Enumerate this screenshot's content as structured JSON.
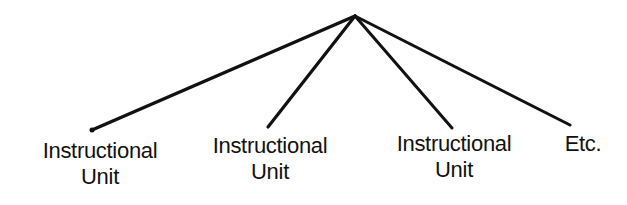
{
  "diagram": {
    "type": "tree",
    "root": {
      "x": 355,
      "y": 16
    },
    "stroke_color": "#111111",
    "branches": [
      {
        "end": {
          "x": 92,
          "y": 130
        },
        "label_lines": [
          "Instructional",
          "Unit"
        ],
        "label_x": 100,
        "label_y": 138
      },
      {
        "end": {
          "x": 268,
          "y": 127
        },
        "label_lines": [
          "Instructional",
          "Unit"
        ],
        "label_x": 270,
        "label_y": 133
      },
      {
        "end": {
          "x": 452,
          "y": 128
        },
        "label_lines": [
          "Instructional",
          "Unit"
        ],
        "label_x": 454,
        "label_y": 131
      },
      {
        "end": {
          "x": 570,
          "y": 125
        },
        "label_lines": [
          "Etc."
        ],
        "label_x": 583,
        "label_y": 131
      }
    ]
  }
}
